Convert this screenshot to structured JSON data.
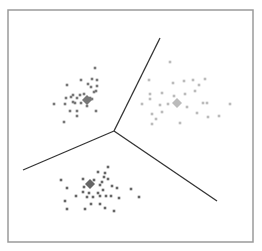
{
  "chart_data": {
    "type": "scatter",
    "title": "",
    "xlabel": "",
    "ylabel": "",
    "grid": false,
    "legend": null,
    "frame": {
      "x1": 8,
      "y1": 10,
      "x2": 253,
      "y2": 242,
      "color": "#9a9a9a"
    },
    "boundaries": {
      "color": "#333333",
      "junction": [
        114,
        131
      ],
      "lines": [
        {
          "from": [
            114,
            131
          ],
          "to": [
            160,
            38
          ]
        },
        {
          "from": [
            114,
            131
          ],
          "to": [
            23,
            170
          ]
        },
        {
          "from": [
            114,
            131
          ],
          "to": [
            217,
            201
          ]
        }
      ]
    },
    "series": [
      {
        "name": "cluster-1",
        "color": "#777777",
        "centroid": [
          87,
          100
        ],
        "points": [
          [
            95,
            68
          ],
          [
            81,
            80
          ],
          [
            92,
            79
          ],
          [
            97,
            80
          ],
          [
            67,
            85
          ],
          [
            88,
            84
          ],
          [
            91,
            87
          ],
          [
            97,
            86
          ],
          [
            96,
            91
          ],
          [
            94,
            92
          ],
          [
            73,
            95
          ],
          [
            80,
            95
          ],
          [
            84,
            94
          ],
          [
            71,
            97
          ],
          [
            77,
            98
          ],
          [
            90,
            98
          ],
          [
            66,
            98
          ],
          [
            54,
            104
          ],
          [
            65,
            104
          ],
          [
            75,
            103
          ],
          [
            81,
            103
          ],
          [
            92,
            99
          ],
          [
            87,
            106
          ],
          [
            96,
            111
          ],
          [
            77,
            111
          ],
          [
            77,
            116
          ],
          [
            64,
            122
          ],
          [
            70,
            111
          ],
          [
            73,
            102
          ]
        ]
      },
      {
        "name": "cluster-2",
        "color": "#bbbbbb",
        "centroid": [
          177,
          103
        ],
        "points": [
          [
            170,
            62
          ],
          [
            149,
            80
          ],
          [
            173,
            83
          ],
          [
            184,
            81
          ],
          [
            193,
            80
          ],
          [
            205,
            79
          ],
          [
            199,
            85
          ],
          [
            195,
            91
          ],
          [
            150,
            94
          ],
          [
            162,
            93
          ],
          [
            185,
            94
          ],
          [
            150,
            99
          ],
          [
            174,
            96
          ],
          [
            142,
            104
          ],
          [
            160,
            105
          ],
          [
            168,
            104
          ],
          [
            187,
            107
          ],
          [
            203,
            103
          ],
          [
            207,
            103
          ],
          [
            230,
            104
          ],
          [
            152,
            114
          ],
          [
            162,
            112
          ],
          [
            197,
            113
          ],
          [
            208,
            117
          ],
          [
            219,
            116
          ],
          [
            152,
            124
          ],
          [
            180,
            123
          ],
          [
            156,
            119
          ]
        ]
      },
      {
        "name": "cluster-3",
        "color": "#666666",
        "centroid": [
          90,
          184
        ],
        "points": [
          [
            108,
            167
          ],
          [
            98,
            172
          ],
          [
            105,
            173
          ],
          [
            104,
            177
          ],
          [
            108,
            179
          ],
          [
            94,
            180
          ],
          [
            102,
            182
          ],
          [
            61,
            180
          ],
          [
            67,
            188
          ],
          [
            84,
            187
          ],
          [
            100,
            185
          ],
          [
            83,
            192
          ],
          [
            89,
            193
          ],
          [
            98,
            193
          ],
          [
            103,
            190
          ],
          [
            112,
            186
          ],
          [
            117,
            188
          ],
          [
            76,
            196
          ],
          [
            87,
            197
          ],
          [
            93,
            197
          ],
          [
            100,
            196
          ],
          [
            106,
            196
          ],
          [
            111,
            196
          ],
          [
            119,
            198
          ],
          [
            65,
            201
          ],
          [
            91,
            204
          ],
          [
            100,
            204
          ],
          [
            67,
            209
          ],
          [
            85,
            209
          ],
          [
            105,
            208
          ],
          [
            114,
            211
          ],
          [
            131,
            189
          ],
          [
            139,
            197
          ],
          [
            83,
            179
          ]
        ]
      }
    ]
  }
}
